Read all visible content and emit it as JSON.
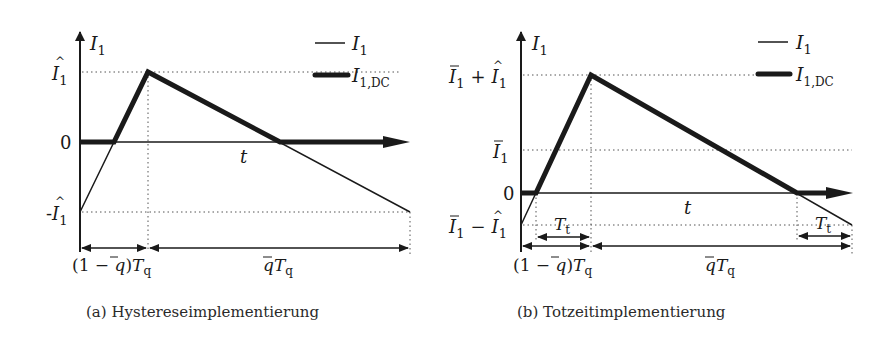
{
  "panel_a": {
    "caption": "(a) Hystereseimplementierung",
    "y_axis_label": "I₁",
    "x_axis_label": "t",
    "y_ticks": [
      "Î₁",
      "0",
      "-Î₁"
    ],
    "legend": [
      {
        "label": "I₁",
        "style": "thin"
      },
      {
        "label": "I₁,DC",
        "style": "thick"
      }
    ],
    "dimensions": [
      "(1 − q̄)Tq",
      "q̄Tq"
    ]
  },
  "panel_b": {
    "caption": "(b) Totzeitimplementierung",
    "y_axis_label": "I₁",
    "x_axis_label": "t",
    "y_ticks": [
      "Ī₁ + Î₁",
      "Ī₁",
      "0",
      "Ī₁ − Î₁"
    ],
    "legend": [
      {
        "label": "I₁",
        "style": "thin"
      },
      {
        "label": "I₁,DC",
        "style": "thick"
      }
    ],
    "dimensions": [
      "Tt",
      "Tt",
      "(1 − q̄)Tq",
      "q̄Tq"
    ]
  },
  "labels": {
    "I1": "I",
    "sub1": "1",
    "subDC": "1,DC",
    "t": "t",
    "zero": "0",
    "minus": "-",
    "plus": "+",
    "T": "T",
    "sub_q": "q",
    "sub_t": "t",
    "one_minus_q_open": "(1 − ",
    "q": "q",
    "close": ")"
  }
}
